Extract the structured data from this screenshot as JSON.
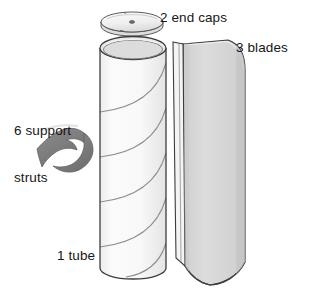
{
  "figure": {
    "type": "exploded-parts-illustration",
    "background_color": "#ffffff"
  },
  "labels": {
    "end_caps": {
      "text": "2 end caps",
      "count": 2,
      "part": "end cap"
    },
    "blades": {
      "text": "3 blades",
      "count": 3,
      "part": "blade"
    },
    "support_struts": {
      "line1": "6 support",
      "line2": "struts",
      "count": 6,
      "part": "support strut"
    },
    "tube": {
      "text": "1 tube",
      "count": 1,
      "part": "tube"
    }
  },
  "parts": [
    {
      "name": "end-cap",
      "shape": "flat ellipse disc with center hole",
      "fill": "#f0f0f0",
      "stroke": "#4a4a4a",
      "label": "2 end caps"
    },
    {
      "name": "tube",
      "shape": "tall cylinder with open elliptical top and helical guide lines",
      "fill": "#f7f7f7",
      "rim_fill": "#e6e6e6",
      "stroke": "#3c3c3c",
      "helix_lines": 5,
      "label": "1 tube"
    },
    {
      "name": "blade",
      "shape": "curved vertical sheet, rounded top-right corner, swept concave bottom edge, narrow left flange",
      "fill": "#d6d6d6",
      "flange_fill": "#f4f4f4",
      "stroke": "#3c3c3c",
      "label": "3 blades"
    },
    {
      "name": "support-strut",
      "shape": "swept curved fin, solid dark gray",
      "fill": "#7f7f7f",
      "stroke": "#5a5a5a",
      "label": "6 support struts"
    }
  ],
  "colors": {
    "ink": "#161616",
    "outline": "#3c3c3c",
    "tube_body": "#f7f7f7",
    "tube_rim": "#e6e6e6",
    "blade_body": "#d6d6d6",
    "blade_flange": "#f4f4f4",
    "strut_body": "#7f7f7f",
    "end_cap_body": "#f0f0f0",
    "background": "#ffffff"
  }
}
